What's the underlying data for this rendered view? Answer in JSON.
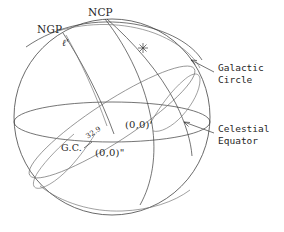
{
  "figure": {
    "kind": "celestial-sphere-diagram",
    "background_color": "#ffffff",
    "line_color": "#3a3a3a",
    "width": 284,
    "height": 232
  },
  "labels": {
    "ncp": "NCP",
    "ngp": "NGP",
    "ell_prime": "ℓ'",
    "galactic_center": "G.C.",
    "origin_prime": "(0,0)'",
    "origin_double_prime": "(0,0)\"",
    "node_angle": "32.9"
  },
  "callouts": {
    "galactic_circle": "Galactic\nCircle",
    "celestial_equator": "Celestial\nEquator"
  },
  "markers": {
    "star": "✳"
  },
  "geometry": {
    "sphere": {
      "cx": 112,
      "cy": 117,
      "r": 98
    },
    "celestial_equator": {
      "cx": 112,
      "cy": 122,
      "rx": 98,
      "ry": 20
    },
    "galactic_circle": {
      "cx": 112,
      "cy": 122,
      "rx": 98,
      "ry": 20,
      "rotation_deg": -33
    }
  }
}
